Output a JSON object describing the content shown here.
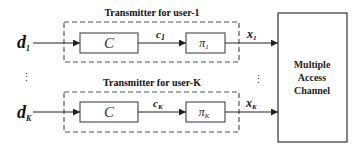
{
  "diagram": {
    "type": "block-diagram",
    "users": [
      {
        "input": {
          "symbol": "d",
          "subscript": "1"
        },
        "group_label": "Transmitter for user-1",
        "encoder": {
          "label": "C"
        },
        "coded": {
          "symbol": "c",
          "subscript": "1"
        },
        "interleaver": {
          "symbol": "π",
          "subscript": "1"
        },
        "output": {
          "symbol": "x",
          "subscript": "1"
        }
      },
      {
        "input": {
          "symbol": "d",
          "subscript": "K"
        },
        "group_label": "Transmitter for user-K",
        "encoder": {
          "label": "C"
        },
        "coded": {
          "symbol": "c",
          "subscript": "K"
        },
        "interleaver": {
          "symbol": "π",
          "subscript": "K"
        },
        "output": {
          "symbol": "x",
          "subscript": "K"
        }
      }
    ],
    "ellipsis": "⋮",
    "channel": {
      "lines": [
        "Multiple",
        "Access",
        "Channel"
      ]
    }
  }
}
